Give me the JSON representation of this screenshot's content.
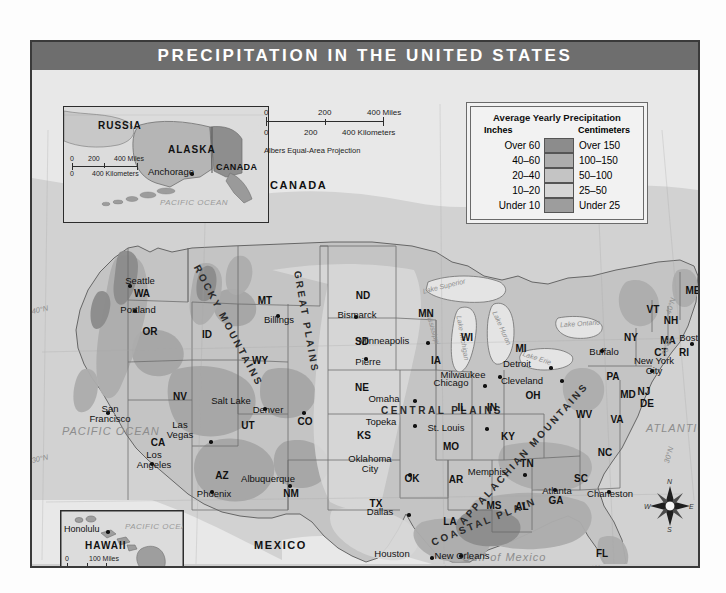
{
  "title": "PRECIPITATION IN THE UNITED STATES",
  "legend": {
    "title": "Average Yearly Precipitation",
    "head_left": "Inches",
    "head_right": "Centimeters",
    "rows": [
      {
        "inches": "Over 60",
        "centimeters": "Over 150",
        "color": "#8c8c8c"
      },
      {
        "inches": "40–60",
        "centimeters": "100–150",
        "color": "#adadad"
      },
      {
        "inches": "20–40",
        "centimeters": "50–100",
        "color": "#c4c4c4"
      },
      {
        "inches": "10–20",
        "centimeters": "25–50",
        "color": "#d6d6d6"
      },
      {
        "inches": "Under 10",
        "centimeters": "Under 25",
        "color": "#9d9d9d"
      }
    ]
  },
  "scale_main": {
    "miles_0": "0",
    "miles_mid": "200",
    "miles_end": "400 Miles",
    "km_0": "0",
    "km_mid": "200",
    "km_end": "400 Kilometers",
    "projection": "Albers Equal-Area Projection"
  },
  "insets": {
    "alaska": {
      "labels": [
        "RUSSIA",
        "ALASKA",
        "CANADA"
      ],
      "russia": "RUSSIA",
      "alaska": "ALASKA",
      "canada": "CANADA",
      "city": "Anchorage",
      "ocean": "PACIFIC OCEAN",
      "scale": {
        "m0": "0",
        "m1": "200",
        "m2": "400 Miles",
        "k0": "0",
        "k2": "400 Kilometers"
      }
    },
    "hawaii": {
      "name": "HAWAII",
      "city": "Honolulu",
      "ocean": "PACIFIC OCEAN",
      "scale": {
        "m0": "0",
        "m2": "100 Miles",
        "k0": "0",
        "k2": "100 Kilometers"
      }
    }
  },
  "countries": {
    "canada": "CANADA",
    "mexico": "MEXICO"
  },
  "oceans": {
    "pacific": "PACIFIC OCEAN",
    "atlantic": "ATLANTIC OCEAN",
    "gulf": "Gulf of Mexico"
  },
  "lakes": [
    {
      "name": "Lake Superior",
      "x": 412,
      "y": 218,
      "rot": -14
    },
    {
      "name": "Lake Michigan",
      "x": 433,
      "y": 262,
      "rot": 78
    },
    {
      "name": "Lake Huron",
      "x": 470,
      "y": 248,
      "rot": 62
    },
    {
      "name": "Lake Erie",
      "x": 500,
      "y": 284,
      "rot": 18
    },
    {
      "name": "Lake Ontario",
      "x": 534,
      "y": 254,
      "rot": 0
    },
    {
      "name": "Mississippi",
      "x": 403,
      "y": 254,
      "rot": 72
    }
  ],
  "regions": [
    {
      "name": "ROCKY MOUNTAINS",
      "x": 196,
      "y": 256,
      "rot": 62
    },
    {
      "name": "GREAT PLAINS",
      "x": 274,
      "y": 252,
      "rot": 78
    },
    {
      "name": "CENTRAL PLAINS",
      "x": 410,
      "y": 341,
      "rot": 0
    },
    {
      "name": "APPALACHIAN MOUNTAINS",
      "x": 490,
      "y": 386,
      "rot": -48
    },
    {
      "name": "COASTAL PLAIN",
      "x": 452,
      "y": 452,
      "rot": -24
    }
  ],
  "coords": [
    {
      "t": "40°N",
      "x": 36,
      "y": 292,
      "rot": -12
    },
    {
      "t": "30°N",
      "x": 36,
      "y": 441,
      "rot": -12
    },
    {
      "t": "40°N",
      "x": 667,
      "y": 288,
      "rot": -72
    },
    {
      "t": "30°N",
      "x": 665,
      "y": 437,
      "rot": -74
    },
    {
      "t": "70°W",
      "x": 663,
      "y": 329,
      "rot": -72
    },
    {
      "t": "120°W",
      "x": 30,
      "y": 552,
      "rot": -4
    },
    {
      "t": "110°W",
      "x": 192,
      "y": 552,
      "rot": -4
    },
    {
      "t": "90°W",
      "x": 432,
      "y": 551,
      "rot": -2
    },
    {
      "t": "80°W",
      "x": 586,
      "y": 551,
      "rot": -4
    }
  ],
  "states": [
    {
      "ab": "WA",
      "x": 110,
      "y": 224
    },
    {
      "ab": "OR",
      "x": 118,
      "y": 262
    },
    {
      "ab": "ID",
      "x": 175,
      "y": 265
    },
    {
      "ab": "MT",
      "x": 233,
      "y": 231
    },
    {
      "ab": "ND",
      "x": 331,
      "y": 226
    },
    {
      "ab": "SD",
      "x": 330,
      "y": 272
    },
    {
      "ab": "NE",
      "x": 330,
      "y": 318
    },
    {
      "ab": "KS",
      "x": 332,
      "y": 366
    },
    {
      "ab": "MN",
      "x": 394,
      "y": 244
    },
    {
      "ab": "WI",
      "x": 435,
      "y": 268
    },
    {
      "ab": "IA",
      "x": 404,
      "y": 291
    },
    {
      "ab": "MI",
      "x": 489,
      "y": 279
    },
    {
      "ab": "IL",
      "x": 430,
      "y": 338
    },
    {
      "ab": "IN",
      "x": 460,
      "y": 338
    },
    {
      "ab": "OH",
      "x": 501,
      "y": 326
    },
    {
      "ab": "MO",
      "x": 419,
      "y": 377
    },
    {
      "ab": "KY",
      "x": 476,
      "y": 367
    },
    {
      "ab": "TN",
      "x": 495,
      "y": 394
    },
    {
      "ab": "WY",
      "x": 228,
      "y": 291
    },
    {
      "ab": "CO",
      "x": 273,
      "y": 352
    },
    {
      "ab": "UT",
      "x": 216,
      "y": 356
    },
    {
      "ab": "NV",
      "x": 148,
      "y": 327
    },
    {
      "ab": "CA",
      "x": 126,
      "y": 373
    },
    {
      "ab": "AZ",
      "x": 190,
      "y": 406
    },
    {
      "ab": "NM",
      "x": 259,
      "y": 424
    },
    {
      "ab": "OK",
      "x": 380,
      "y": 409
    },
    {
      "ab": "TX",
      "x": 344,
      "y": 434
    },
    {
      "ab": "AR",
      "x": 424,
      "y": 410
    },
    {
      "ab": "LA",
      "x": 418,
      "y": 452
    },
    {
      "ab": "MS",
      "x": 462,
      "y": 436
    },
    {
      "ab": "AL",
      "x": 490,
      "y": 437
    },
    {
      "ab": "GA",
      "x": 524,
      "y": 431
    },
    {
      "ab": "FL",
      "x": 570,
      "y": 484
    },
    {
      "ab": "SC",
      "x": 549,
      "y": 409
    },
    {
      "ab": "NC",
      "x": 573,
      "y": 383
    },
    {
      "ab": "VA",
      "x": 585,
      "y": 350
    },
    {
      "ab": "WV",
      "x": 552,
      "y": 345
    },
    {
      "ab": "PA",
      "x": 581,
      "y": 307
    },
    {
      "ab": "NY",
      "x": 599,
      "y": 268
    },
    {
      "ab": "ME",
      "x": 661,
      "y": 221
    },
    {
      "ab": "VT",
      "x": 621,
      "y": 240
    },
    {
      "ab": "NH",
      "x": 639,
      "y": 251
    },
    {
      "ab": "MA",
      "x": 636,
      "y": 271
    },
    {
      "ab": "CT",
      "x": 629,
      "y": 283
    },
    {
      "ab": "RI",
      "x": 652,
      "y": 283
    },
    {
      "ab": "NJ",
      "x": 612,
      "y": 322
    },
    {
      "ab": "DE",
      "x": 615,
      "y": 334
    },
    {
      "ab": "MD",
      "x": 596,
      "y": 325
    }
  ],
  "cities": [
    {
      "n": "Seattle",
      "x": 108,
      "y": 211,
      "dx": 96,
      "dy": 214
    },
    {
      "n": "Portland",
      "x": 106,
      "y": 240,
      "dx": 101,
      "dy": 239
    },
    {
      "n": "Billings",
      "x": 247,
      "y": 250,
      "dx": 244,
      "dy": 244
    },
    {
      "n": "Bismarck",
      "x": 325,
      "y": 245,
      "dx": 322,
      "dy": 245
    },
    {
      "n": "Minneapolis",
      "x": 352,
      "y": 271,
      "dx": 394,
      "dy": 271
    },
    {
      "n": "Pierre",
      "x": 336,
      "y": 292,
      "dx": 332,
      "dy": 287
    },
    {
      "n": "Milwaukee",
      "x": 431,
      "y": 305,
      "dx": 466,
      "dy": 305
    },
    {
      "n": "Omaha",
      "x": 352,
      "y": 329,
      "dx": 381,
      "dy": 329
    },
    {
      "n": "Chicago",
      "x": 419,
      "y": 313,
      "dx": 451,
      "dy": 314
    },
    {
      "n": "Detroit",
      "x": 485,
      "y": 294,
      "dx": 517,
      "dy": 296
    },
    {
      "n": "Cleveland",
      "x": 490,
      "y": 311,
      "dx": 528,
      "dy": 309
    },
    {
      "n": "Buffalo",
      "x": 572,
      "y": 282,
      "dx": 568,
      "dy": 279
    },
    {
      "n": "Boston",
      "x": 662,
      "y": 268,
      "dx": 658,
      "dy": 272
    },
    {
      "n": "Topeka",
      "x": 349,
      "y": 352,
      "dx": 381,
      "dy": 354
    },
    {
      "n": "St. Louis",
      "x": 414,
      "y": 358,
      "dx": 453,
      "dy": 357
    },
    {
      "n": "Denver",
      "x": 236,
      "y": 340,
      "dx": 270,
      "dy": 341
    },
    {
      "n": "Salt Lake",
      "x": 199,
      "y": 331,
      "dx": 231,
      "dy": 337
    },
    {
      "n": "San",
      "x": 78,
      "y": 344,
      "dx": 74,
      "dy": 341
    },
    {
      "n": "Las",
      "x": 148,
      "y": 360,
      "dx": 177,
      "dy": 370
    },
    {
      "n": "Los",
      "x": 122,
      "y": 390,
      "dx": 118,
      "dy": 392
    },
    {
      "n": "Phoenix",
      "x": 182,
      "y": 424,
      "dx": 178,
      "dy": 420
    },
    {
      "n": "Albuquerque",
      "x": 236,
      "y": 409,
      "dx": 256,
      "dy": 414
    },
    {
      "n": "Oklahoma",
      "x": 338,
      "y": 394,
      "dx": 376,
      "dy": 403
    },
    {
      "n": "Dallas",
      "x": 348,
      "y": 442,
      "dx": 375,
      "dy": 443
    },
    {
      "n": "Houston",
      "x": 360,
      "y": 484,
      "dx": 398,
      "dy": 486
    },
    {
      "n": "Memphis",
      "x": 455,
      "y": 402,
      "dx": 491,
      "dy": 403
    },
    {
      "n": "Atlanta",
      "x": 525,
      "y": 421,
      "dx": 521,
      "dy": 418
    },
    {
      "n": "New Orleans",
      "x": 430,
      "y": 486,
      "dx": 427,
      "dy": 484
    },
    {
      "n": "Charleston",
      "x": 578,
      "y": 424,
      "dx": 575,
      "dy": 420
    },
    {
      "n": "Miami",
      "x": 596,
      "y": 521,
      "dx": 617,
      "dy": 519
    },
    {
      "n": "New York",
      "x": 622,
      "y": 296,
      "dx": 618,
      "dy": 299
    }
  ],
  "city_multiline": [
    {
      "l1": "Salt",
      "l2": "Lake",
      "l3": "City",
      "x": 199,
      "y": 331
    },
    {
      "l1": "Des",
      "l2": "Moines",
      "x": 396,
      "y": 300
    },
    {
      "l1": "San",
      "l2": "Francisco",
      "x": 78,
      "y": 344
    },
    {
      "l1": "Las",
      "l2": "Vegas",
      "x": 148,
      "y": 360
    },
    {
      "l1": "Los",
      "l2": "Angeles",
      "x": 122,
      "y": 390
    },
    {
      "l1": "Oklahoma",
      "l2": "City",
      "x": 338,
      "y": 394
    },
    {
      "l1": "New York",
      "l2": "City",
      "x": 622,
      "y": 296
    }
  ]
}
